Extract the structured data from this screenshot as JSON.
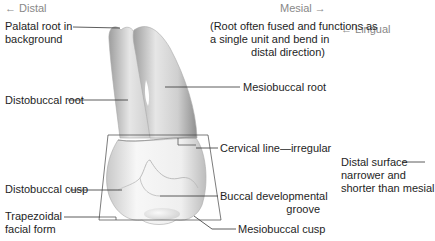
{
  "diagram": {
    "orientation": {
      "left": "← Distal",
      "top_right": "Mesial →",
      "right": "← Lingual"
    },
    "labels": {
      "palatal_root": [
        "Palatal root in",
        "background"
      ],
      "distobuccal_root": "Distobuccal root",
      "mesiobuccal_root": "Mesiobuccal root",
      "root_note": [
        "(Root often fused and functions as",
        "a single unit and bend in",
        "distal direction)"
      ],
      "cervical_line": "Cervical line—irregular",
      "distal_surface": [
        "Distal surface",
        "narrower and",
        "shorter than mesial"
      ],
      "distobuccal_cusp": "Distobuccal cusp",
      "buccal_groove": [
        "Buccal developmental",
        "groove"
      ],
      "trapezoidal": [
        "Trapezoidal",
        "facial form"
      ],
      "mesiobuccal_cusp": "Mesiobuccal cusp"
    },
    "colors": {
      "tooth_light": "#f2f2f2",
      "tooth_shade": "#b8b8b8",
      "leader_line": "#333333",
      "label_text": "#1e1e1e",
      "direction_text": "#888888"
    }
  }
}
